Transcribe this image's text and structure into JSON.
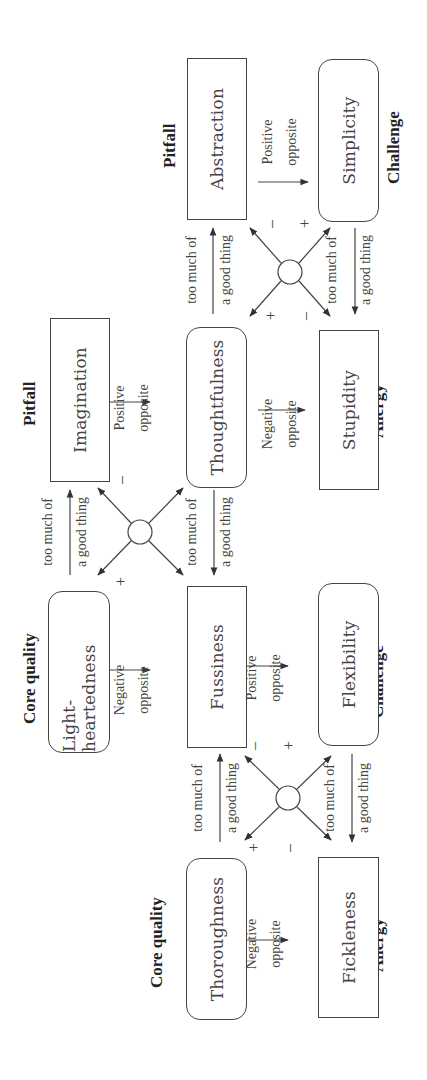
{
  "diagram": {
    "quadrants": [
      {
        "core_quality": {
          "role_label": "Core quality",
          "text": "Thoroughness"
        },
        "pitfall": {
          "role_label": "",
          "text": "Fussiness"
        },
        "challenge": {
          "role_label": "Challenge",
          "text": "Flexibility"
        },
        "allergy": {
          "role_label": "Allergy",
          "text": "Fickleness"
        }
      },
      {
        "core_quality": {
          "role_label": "Core quality",
          "text": "Light-heartedness"
        },
        "pitfall": {
          "role_label": "Pitfall",
          "text": "Imagination"
        },
        "challenge": {
          "role_label": "",
          "text": "Thoughtfulness"
        },
        "allergy": {
          "role_label": "Allergy",
          "text": "Stupidity"
        }
      },
      {
        "core_quality": {
          "role_label": "",
          "text": "Thoughtfulness"
        },
        "pitfall": {
          "role_label": "Pitfall",
          "text": "Abstraction"
        },
        "challenge": {
          "role_label": "Challenge",
          "text": "Simplicity"
        },
        "allergy": {
          "role_label": "Allergy",
          "text": "Stupidity"
        }
      }
    ],
    "role_labels": {
      "core_quality_1": "Core quality",
      "core_quality_2": "Core quality",
      "pitfall_1": "Pitfall",
      "pitfall_2": "Pitfall",
      "challenge_1": "Challenge",
      "challenge_2": "Challenge",
      "allergy_1": "Allergy",
      "allergy_2": "Allergy"
    },
    "boxes": {
      "thoroughness": "Thoroughness",
      "fickleness": "Fickleness",
      "light_heartedness": "Light-heartedness",
      "fussiness": "Fussiness",
      "flexibility": "Flexibility",
      "imagination": "Imagination",
      "thoughtfulness": "Thoughtfulness",
      "stupidity": "Stupidity",
      "abstraction": "Abstraction",
      "simplicity": "Simplicity"
    },
    "edge_labels": {
      "too_much_line1": "too much of",
      "too_much_line2": "a good thing",
      "negative_line1": "Negative",
      "negative_line2": "opposite",
      "positive_line1": "Positive",
      "positive_line2": "opposite",
      "plus": "+",
      "minus": "–"
    },
    "colors": {
      "stroke": "#444444",
      "text": "#333333",
      "background": "#ffffff"
    }
  }
}
